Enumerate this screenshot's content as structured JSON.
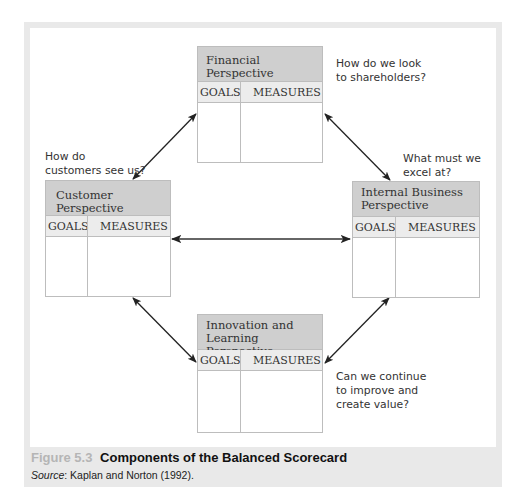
{
  "perspectives": {
    "financial": {
      "title": "Financial Perspective",
      "goals_label": "GOALS",
      "measures_label": "MEASURES",
      "question_line1": "How do we look",
      "question_line2": "to shareholders?"
    },
    "customer": {
      "title": "Customer Perspective",
      "goals_label": "GOALS",
      "measures_label": "MEASURES",
      "question_line1": "How do",
      "question_line2": "customers see us?"
    },
    "internal": {
      "title_line1": "Internal Business",
      "title_line2": "Perspective",
      "goals_label": "GOALS",
      "measures_label": "MEASURES",
      "question_line1": "What must we",
      "question_line2": "excel at?"
    },
    "innovation": {
      "title_line1": "Innovation and",
      "title_line2": "Learning Perspective",
      "goals_label": "GOALS",
      "measures_label": "MEASURES",
      "question_line1": "Can we continue",
      "question_line2": "to improve and",
      "question_line3": "create value?"
    }
  },
  "arrows": [
    {
      "from": "customer",
      "to": "financial",
      "type": "bidirectional"
    },
    {
      "from": "financial",
      "to": "internal",
      "type": "bidirectional"
    },
    {
      "from": "customer",
      "to": "internal",
      "type": "bidirectional"
    },
    {
      "from": "customer",
      "to": "innovation",
      "type": "bidirectional"
    },
    {
      "from": "internal",
      "to": "innovation",
      "type": "bidirectional"
    }
  ],
  "caption": {
    "figure_number": "Figure 5.3",
    "title": "Components of the Balanced Scorecard",
    "source_label": "Source",
    "source_text": ": Kaplan and Norton (1992)."
  },
  "colors": {
    "header_bg": "#cfcfcf",
    "subheader_bg": "#ececec",
    "frame_bg": "#e9e9e9",
    "figure_number": "#b5b5b5"
  }
}
